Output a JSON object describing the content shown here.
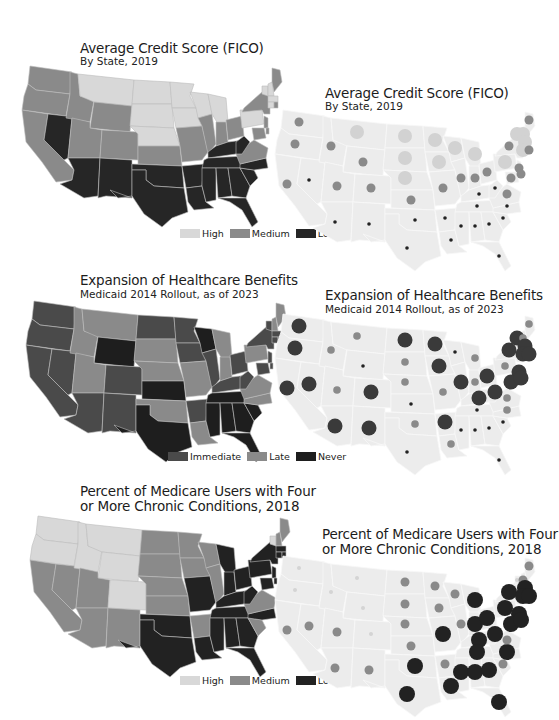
{
  "chart_data": [
    {
      "type": "heatmap",
      "subtype": "choropleth",
      "title": "Average Credit Score (FICO)",
      "subtitle": "By State, 2019",
      "legend": [
        {
          "label": "High",
          "color": "#d4d4d4"
        },
        {
          "label": "Medium",
          "color": "#8c8c8c"
        },
        {
          "label": "Low",
          "color": "#2a2a2a"
        }
      ],
      "legend_position": "bottom-right",
      "categories": {
        "High": [
          "MT",
          "ND",
          "SD",
          "NE",
          "MN",
          "IA",
          "WI",
          "MI",
          "PA",
          "VT",
          "NH",
          "MA",
          "CT"
        ],
        "Medium": [
          "WA",
          "OR",
          "CA",
          "ID",
          "UT",
          "WY",
          "CO",
          "KS",
          "MO",
          "IL",
          "IN",
          "OH",
          "VA",
          "MD",
          "DE",
          "NJ",
          "NY",
          "ME",
          "RI"
        ],
        "Low": [
          "NV",
          "AZ",
          "NM",
          "TX",
          "OK",
          "AR",
          "LA",
          "MS",
          "AL",
          "TN",
          "KY",
          "WV",
          "GA",
          "FL",
          "SC",
          "NC"
        ]
      }
    },
    {
      "type": "scatter",
      "subtype": "bubble-map",
      "title": "Average Credit Score (FICO)",
      "subtitle": "By State, 2019",
      "encoding": "High = large light circle, Medium = medium grey circle, Low = small dark dot",
      "categories": {
        "High": [
          "MT",
          "ND",
          "SD",
          "NE",
          "MN",
          "IA",
          "WI",
          "MI",
          "PA",
          "VT",
          "NH",
          "MA",
          "CT"
        ],
        "Medium": [
          "WA",
          "OR",
          "CA",
          "ID",
          "UT",
          "WY",
          "CO",
          "KS",
          "MO",
          "IL",
          "IN",
          "OH",
          "VA",
          "MD",
          "DE",
          "NJ",
          "NY",
          "ME",
          "RI"
        ],
        "Low": [
          "NV",
          "AZ",
          "NM",
          "TX",
          "OK",
          "AR",
          "LA",
          "MS",
          "AL",
          "TN",
          "KY",
          "WV",
          "GA",
          "FL",
          "SC",
          "NC"
        ]
      }
    },
    {
      "type": "heatmap",
      "subtype": "choropleth",
      "title": "Expansion of Healthcare Benefits",
      "subtitle": "Medicaid 2014 Rollout, as of 2023",
      "legend": [
        {
          "label": "Immediate",
          "color": "#4a4a4a"
        },
        {
          "label": "Late",
          "color": "#8a8a8a"
        },
        {
          "label": "Never",
          "color": "#1e1e1e"
        }
      ],
      "legend_position": "bottom-right",
      "categories": {
        "Immediate": [
          "WA",
          "OR",
          "CA",
          "NV",
          "AZ",
          "NM",
          "CO",
          "ND",
          "MN",
          "IA",
          "IL",
          "KY",
          "OH",
          "WV",
          "NY",
          "VT",
          "RI",
          "CT",
          "NJ",
          "MD",
          "DE",
          "MA",
          "AR"
        ],
        "Late": [
          "ID",
          "MT",
          "UT",
          "SD",
          "NE",
          "OK",
          "MO",
          "LA",
          "MI",
          "IN",
          "PA",
          "VA",
          "NC",
          "NH",
          "ME"
        ],
        "Never": [
          "WY",
          "KS",
          "TX",
          "WI",
          "TN",
          "MS",
          "AL",
          "GA",
          "SC",
          "FL"
        ]
      }
    },
    {
      "type": "scatter",
      "subtype": "bubble-map",
      "title": "Expansion of Healthcare Benefits",
      "subtitle": "Medicaid 2014 Rollout, as of 2023",
      "encoding": "Immediate = large dark circle, Late = medium grey circle, Never = small dark dot",
      "categories": {
        "Immediate": [
          "WA",
          "OR",
          "CA",
          "NV",
          "AZ",
          "NM",
          "CO",
          "ND",
          "MN",
          "IA",
          "IL",
          "KY",
          "OH",
          "WV",
          "NY",
          "VT",
          "RI",
          "CT",
          "NJ",
          "MD",
          "DE",
          "MA",
          "AR"
        ],
        "Late": [
          "ID",
          "MT",
          "UT",
          "SD",
          "NE",
          "OK",
          "MO",
          "LA",
          "MI",
          "IN",
          "PA",
          "VA",
          "NC",
          "NH",
          "ME"
        ],
        "Never": [
          "WY",
          "KS",
          "TX",
          "WI",
          "TN",
          "MS",
          "AL",
          "GA",
          "SC",
          "FL"
        ]
      }
    },
    {
      "type": "heatmap",
      "subtype": "choropleth",
      "title": "Percent of Medicare Users with Four or More Chronic Conditions, 2018",
      "legend": [
        {
          "label": "High",
          "color": "#d6d6d6"
        },
        {
          "label": "Medium",
          "color": "#8a8a8a"
        },
        {
          "label": "Low",
          "color": "#222222"
        }
      ],
      "legend_position": "bottom-right",
      "categories": {
        "High": [
          "WA",
          "OR",
          "ID",
          "MT",
          "WY",
          "CO",
          "VT"
        ],
        "Medium": [
          "CA",
          "NV",
          "UT",
          "AZ",
          "NM",
          "ND",
          "SD",
          "NE",
          "KS",
          "MN",
          "IA",
          "WI",
          "IL",
          "AR",
          "VA",
          "SC",
          "NH",
          "ME"
        ],
        "Low": [
          "TX",
          "OK",
          "MO",
          "LA",
          "MS",
          "AL",
          "GA",
          "FL",
          "TN",
          "KY",
          "NC",
          "WV",
          "IN",
          "OH",
          "MI",
          "PA",
          "NY",
          "NJ",
          "MD",
          "DE",
          "CT",
          "RI",
          "MA"
        ]
      }
    },
    {
      "type": "scatter",
      "subtype": "bubble-map",
      "title": "Percent of Medicare Users with Four or More Chronic Conditions, 2018",
      "encoding": "High = small light dot, Medium = medium grey circle, Low = large dark circle",
      "categories": {
        "High": [
          "WA",
          "OR",
          "ID",
          "MT",
          "WY",
          "CO",
          "VT"
        ],
        "Medium": [
          "CA",
          "NV",
          "UT",
          "AZ",
          "NM",
          "ND",
          "SD",
          "NE",
          "KS",
          "MN",
          "IA",
          "WI",
          "IL",
          "AR",
          "VA",
          "SC",
          "NH",
          "ME"
        ],
        "Low": [
          "TX",
          "OK",
          "MO",
          "LA",
          "MS",
          "AL",
          "GA",
          "FL",
          "TN",
          "KY",
          "NC",
          "WV",
          "IN",
          "OH",
          "MI",
          "PA",
          "NY",
          "NJ",
          "MD",
          "DE",
          "CT",
          "RI",
          "MA"
        ]
      }
    }
  ],
  "panels": {
    "fico_map": {
      "title": "Average Credit Score (FICO)",
      "subtitle": "By State, 2019"
    },
    "fico_bubble": {
      "title": "Average Credit Score (FICO)",
      "subtitle": "By State, 2019"
    },
    "fico_legend": {
      "high": "High",
      "medium": "Medium",
      "low": "Low"
    },
    "medicaid_map": {
      "title": "Expansion of Healthcare Benefits",
      "subtitle": "Medicaid 2014 Rollout, as of 2023"
    },
    "medicaid_bubble": {
      "title": "Expansion of Healthcare Benefits",
      "subtitle": "Medicaid 2014 Rollout, as of 2023"
    },
    "medicaid_legend": {
      "immediate": "Immediate",
      "late": "Late",
      "never": "Never"
    },
    "medicare_map": {
      "title_line1": "Percent of Medicare Users with Four",
      "title_line2": "or More Chronic Conditions, 2018"
    },
    "medicare_bubble": {
      "title_line1": "Percent of Medicare Users with Four",
      "title_line2": "or More Chronic Conditions, 2018"
    },
    "medicare_legend": {
      "high": "High",
      "medium": "Medium",
      "low": "Low"
    }
  },
  "colors": {
    "light": "#d4d4d4",
    "medium": "#8a8a8a",
    "dark": "#262626",
    "immediate": "#4a4a4a",
    "silhouette": "#ececec",
    "border": "#f4f4f4"
  }
}
